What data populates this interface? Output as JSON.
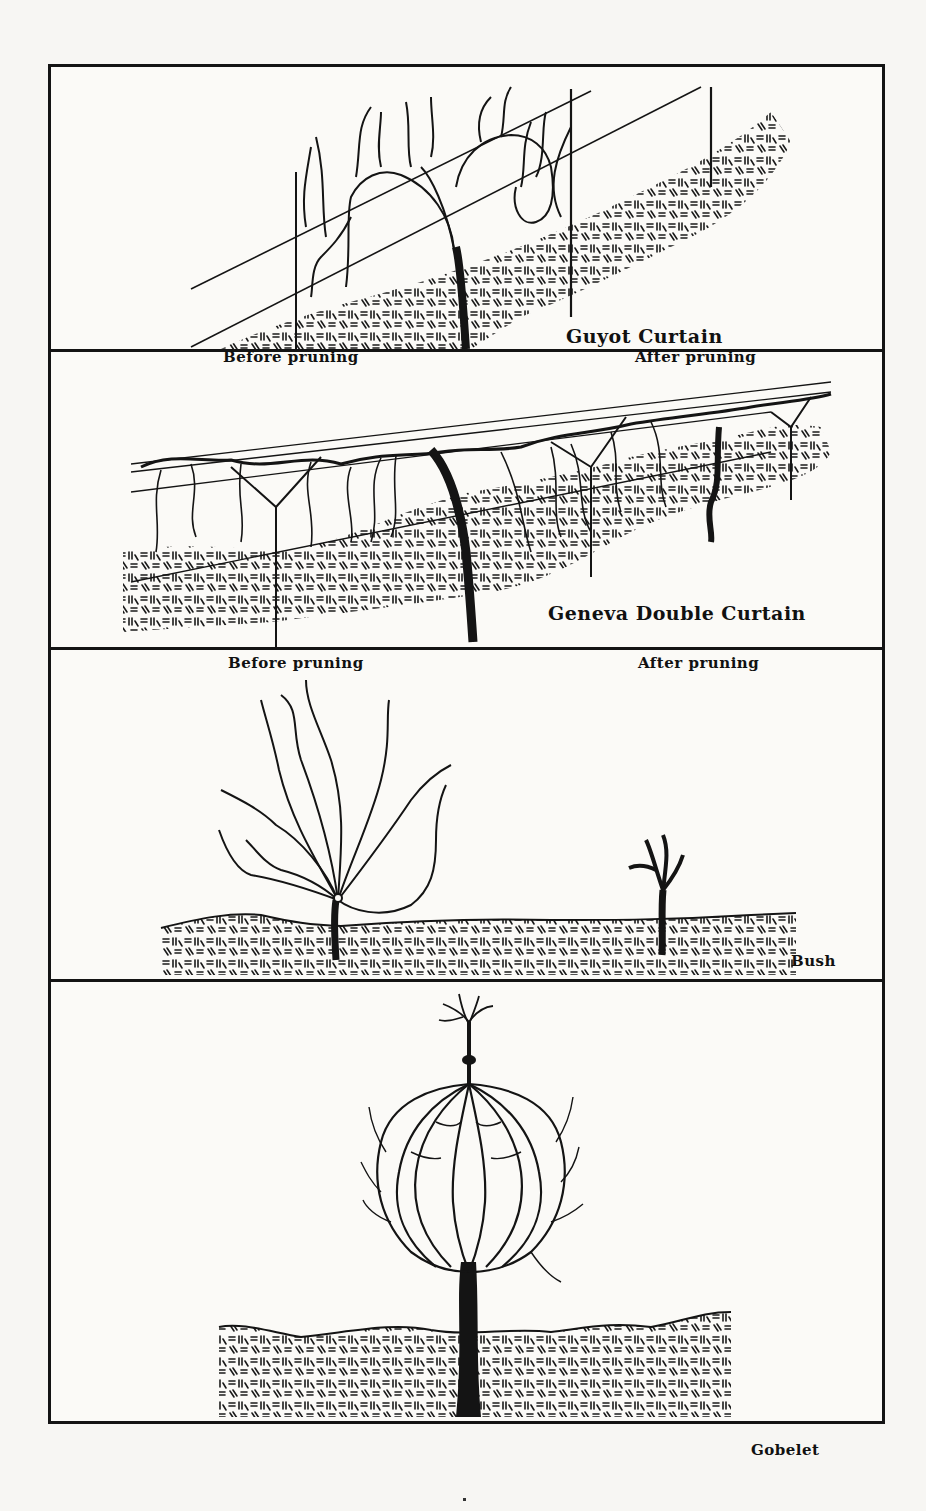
{
  "figure": {
    "panels": [
      {
        "id": "guyot-curtain",
        "title": "Guyot Curtain",
        "labels": []
      },
      {
        "id": "geneva-double-curtain",
        "title": "Geneva Double Curtain",
        "labels": [
          "Before pruning",
          "After pruning"
        ]
      },
      {
        "id": "bush",
        "title": "Bush",
        "labels": [
          "Before pruning",
          "After pruning"
        ]
      },
      {
        "id": "gobelet",
        "title": "Gobelet",
        "labels": []
      }
    ],
    "colors": {
      "ink": "#141414",
      "paper": "#f7f6f3",
      "soil_hatching": "#1a1a1a"
    }
  }
}
